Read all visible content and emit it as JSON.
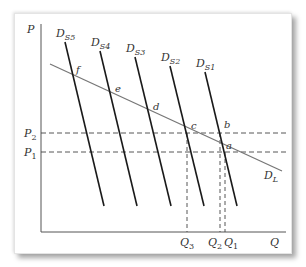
{
  "diagram": {
    "axes": {
      "y_label": "P",
      "x_label": "Q"
    },
    "price_levels": [
      {
        "label": "P",
        "sub": "2",
        "y": 133
      },
      {
        "label": "P",
        "sub": "1",
        "y": 152
      }
    ],
    "quantity_levels": [
      {
        "label": "Q",
        "sub": "3",
        "x": 187
      },
      {
        "label": "Q",
        "sub": "2",
        "x": 220
      },
      {
        "label": "Q",
        "sub": "1",
        "x": 225
      }
    ],
    "long_run_demand": {
      "label": "D",
      "sub": "L"
    },
    "short_run_demands": [
      {
        "label": "D",
        "sub": "S5"
      },
      {
        "label": "D",
        "sub": "S4"
      },
      {
        "label": "D",
        "sub": "S3"
      },
      {
        "label": "D",
        "sub": "S2"
      },
      {
        "label": "D",
        "sub": "S1"
      }
    ],
    "points": [
      "a",
      "b",
      "c",
      "d",
      "e",
      "f"
    ],
    "colors": {
      "short_run_line": "#1a1a1a",
      "long_run_line": "#777777",
      "dashed": "#444444",
      "axis": "#555555"
    }
  }
}
